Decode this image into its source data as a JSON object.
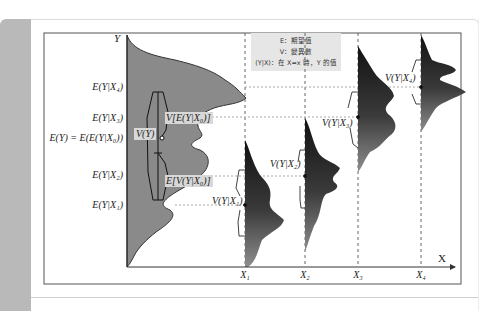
{
  "diagram": {
    "axes": {
      "y_label": "Y",
      "x_label": "X"
    },
    "legend": {
      "lines": [
        "E：期望值",
        "V：變異數",
        "(Y|X)：在 X=x 時，Y 的值"
      ]
    },
    "y_tick_labels": [
      {
        "id": "e_y_x4",
        "text": "E(Y|X₄)"
      },
      {
        "id": "e_y_x3",
        "text": "E(Y|X₃)"
      },
      {
        "id": "e_y",
        "text": "E(Y) = E(E(Y|X₀))"
      },
      {
        "id": "e_y_x2",
        "text": "E(Y|X₂)"
      },
      {
        "id": "e_y_x1",
        "text": "E(Y|X₁)"
      }
    ],
    "x_tick_labels": [
      {
        "id": "x1",
        "text": "X₁"
      },
      {
        "id": "x2",
        "text": "X₂"
      },
      {
        "id": "x3",
        "text": "X₃"
      },
      {
        "id": "x4",
        "text": "X₄"
      }
    ],
    "annotations": {
      "v_y": "V(Y)",
      "v_e": "V[E(Y|X₀)]",
      "e_v": "E[V(Y|X₀)]",
      "v_y_x1": "V(Y|X₁)",
      "v_y_x2": "V(Y|X₂)",
      "v_y_x3": "V(Y|X₃)",
      "v_y_x4": "V(Y|X₄)"
    },
    "colors": {
      "marginal_fill": "#8a8a8a",
      "conditional_dark": "#1a1a1a",
      "conditional_light": "#8c8c8c",
      "frame": "#555555",
      "dashed": "#666666",
      "legend_bg": "#e6e6e6",
      "side_panel": "#b9b9b9"
    }
  }
}
